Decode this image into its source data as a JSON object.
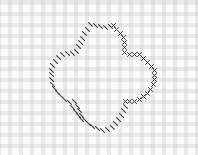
{
  "pattern": {
    "background": "gingham-grid",
    "colors": {
      "fabric": "#fbfbfb",
      "grid": "#bebebe",
      "thread": "#3a3a3a"
    },
    "cross_stitches": [
      [
        111,
        23
      ],
      [
        114,
        27
      ],
      [
        118,
        31
      ],
      [
        121,
        35
      ],
      [
        122,
        40
      ],
      [
        122,
        45
      ],
      [
        122,
        50
      ],
      [
        127,
        52
      ],
      [
        132,
        52
      ],
      [
        137,
        52
      ],
      [
        141,
        56
      ],
      [
        145,
        60
      ],
      [
        149,
        64
      ],
      [
        152,
        68
      ],
      [
        152,
        73
      ],
      [
        152,
        77
      ],
      [
        151,
        82
      ],
      [
        148,
        87
      ],
      [
        145,
        91
      ],
      [
        141,
        94
      ],
      [
        137,
        97
      ],
      [
        132,
        99
      ],
      [
        127,
        99
      ],
      [
        123,
        99
      ]
    ],
    "dash_stitches": [
      [
        88,
        22
      ],
      [
        93,
        23
      ],
      [
        98,
        24
      ],
      [
        103,
        25
      ],
      [
        108,
        24
      ],
      [
        85,
        27
      ],
      [
        82,
        31
      ],
      [
        80,
        36
      ],
      [
        78,
        40
      ],
      [
        76,
        44
      ],
      [
        74,
        49
      ],
      [
        70,
        51
      ],
      [
        65,
        51
      ],
      [
        60,
        52
      ],
      [
        56,
        55
      ],
      [
        53,
        59
      ],
      [
        50,
        63
      ],
      [
        49,
        68
      ],
      [
        49,
        72
      ],
      [
        49,
        77
      ],
      [
        50,
        82
      ],
      [
        52,
        86
      ],
      [
        55,
        90
      ],
      [
        58,
        93
      ],
      [
        62,
        97
      ],
      [
        67,
        100
      ],
      [
        72,
        99
      ],
      [
        75,
        104
      ],
      [
        77,
        108
      ],
      [
        79,
        113
      ],
      [
        82,
        117
      ],
      [
        86,
        121
      ],
      [
        90,
        124
      ],
      [
        95,
        126
      ],
      [
        100,
        128
      ],
      [
        105,
        127
      ],
      [
        110,
        125
      ],
      [
        113,
        121
      ],
      [
        116,
        117
      ],
      [
        119,
        113
      ],
      [
        121,
        108
      ],
      [
        123,
        104
      ],
      [
        70,
        105
      ],
      [
        73,
        109
      ],
      [
        76,
        113
      ],
      [
        79,
        117
      ]
    ]
  }
}
